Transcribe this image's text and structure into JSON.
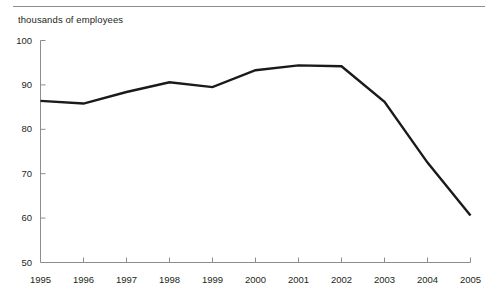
{
  "chart_data": {
    "type": "line",
    "title": "thousands of employees",
    "subtitle": "",
    "xlabel": "",
    "ylabel": "thousands of employees",
    "x": [
      1995,
      1996,
      1997,
      1998,
      1999,
      2000,
      2001,
      2002,
      2003,
      2004,
      2005
    ],
    "categories": [
      "1995",
      "1996",
      "1997",
      "1998",
      "1999",
      "2000",
      "2001",
      "2002",
      "2003",
      "2004",
      "2005"
    ],
    "values": [
      86.4,
      85.8,
      88.4,
      90.6,
      89.5,
      93.3,
      94.4,
      94.2,
      86.2,
      72.5,
      60.6
    ],
    "series": [
      {
        "name": "employees",
        "values": [
          86.4,
          85.8,
          88.4,
          90.6,
          89.5,
          93.3,
          94.4,
          94.2,
          86.2,
          72.5,
          60.6
        ]
      }
    ],
    "ylim": [
      50,
      100
    ],
    "yticks": [
      50,
      60,
      70,
      80,
      90,
      100
    ],
    "ytick_labels": [
      "50",
      "60",
      "70",
      "80",
      "90",
      "100"
    ],
    "xtick_labels": [
      "1995",
      "1996",
      "1997",
      "1998",
      "1999",
      "2000",
      "2001",
      "2002",
      "2003",
      "2004",
      "2005"
    ],
    "grid": false,
    "legend": false,
    "legend_position": "none",
    "line_color": "#1a1a1a",
    "line_width": 2.4,
    "axis_color": "#8d8d8d",
    "text_color": "#231f20",
    "annotations": []
  },
  "figure": {
    "top_rule_color": "#8d8d8d",
    "background": "#ffffff"
  }
}
